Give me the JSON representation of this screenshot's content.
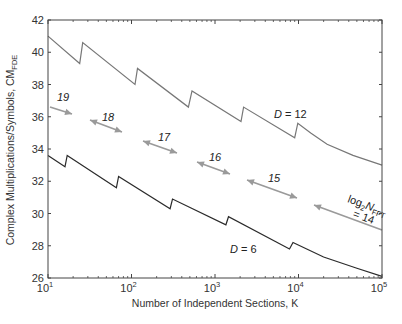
{
  "chart_data": {
    "type": "line",
    "title": "",
    "xlabel": "Number of Independent Sections, K",
    "ylabel": "Complex Multiplications/Symbols, CM",
    "ylabel_subscript": "FDE",
    "xscale": "log",
    "xlim": [
      10,
      100000
    ],
    "ylim": [
      26,
      42
    ],
    "grid": false,
    "x_tick_labels": [
      {
        "base": "10",
        "exp": "1",
        "value": 10
      },
      {
        "base": "10",
        "exp": "2",
        "value": 100
      },
      {
        "base": "10",
        "exp": "3",
        "value": 1000
      },
      {
        "base": "10",
        "exp": "4",
        "value": 10000
      },
      {
        "base": "10",
        "exp": "5",
        "value": 100000
      }
    ],
    "y_ticks": [
      26,
      28,
      30,
      32,
      34,
      36,
      38,
      40,
      42
    ],
    "series": [
      {
        "name": "D = 12",
        "label_italic": "D",
        "label_rest": " = 12",
        "color": "#777777",
        "points": [
          [
            10,
            41.0
          ],
          [
            24,
            39.3
          ],
          [
            26,
            40.6
          ],
          [
            110,
            38.0
          ],
          [
            118,
            39.0
          ],
          [
            480,
            36.6
          ],
          [
            530,
            37.6
          ],
          [
            2050,
            35.7
          ],
          [
            2200,
            36.6
          ],
          [
            9000,
            34.7
          ],
          [
            9800,
            35.6
          ],
          [
            14000,
            35.0
          ],
          [
            22000,
            34.3
          ],
          [
            45000,
            33.6
          ],
          [
            100000,
            33.0
          ]
        ]
      },
      {
        "name": "D = 6",
        "label_italic": "D",
        "label_rest": " = 6",
        "color": "#2b2b2b",
        "points": [
          [
            10,
            33.6
          ],
          [
            16,
            32.9
          ],
          [
            17,
            33.6
          ],
          [
            66,
            31.6
          ],
          [
            70,
            32.3
          ],
          [
            290,
            30.3
          ],
          [
            310,
            30.9
          ],
          [
            1350,
            29.3
          ],
          [
            1450,
            29.8
          ],
          [
            7800,
            27.8
          ],
          [
            8600,
            28.2
          ],
          [
            20000,
            27.3
          ],
          [
            50000,
            26.6
          ],
          [
            100000,
            26.1
          ]
        ]
      }
    ],
    "annotations": [
      {
        "text": "19",
        "type": "arrow-label",
        "x_px": 65,
        "y_px": 99
      },
      {
        "text": "18",
        "type": "arrow-label",
        "x_px": 107,
        "y_px": 120
      },
      {
        "text": "17",
        "type": "arrow-label",
        "x_px": 162,
        "y_px": 140
      },
      {
        "text": "16",
        "type": "arrow-label",
        "x_px": 214,
        "y_px": 160
      },
      {
        "text": "15",
        "type": "arrow-label",
        "x_px": 273,
        "y_px": 180
      },
      {
        "text_main": "log",
        "text_sub": "2",
        "text_N": "N",
        "text_subN": "FFT",
        "text_eq": "= 14",
        "type": "arrow-label"
      }
    ],
    "arrows": [
      {
        "label": "19",
        "x1": 50,
        "y1": 107,
        "x2": 72,
        "y2": 114,
        "heads": "end"
      },
      {
        "label": "18",
        "x1": 90,
        "y1": 120,
        "x2": 122,
        "y2": 132,
        "heads": "both"
      },
      {
        "label": "17",
        "x1": 143,
        "y1": 141,
        "x2": 177,
        "y2": 153,
        "heads": "both"
      },
      {
        "label": "16",
        "x1": 197,
        "y1": 162,
        "x2": 230,
        "y2": 174,
        "heads": "both"
      },
      {
        "label": "15",
        "x1": 247,
        "y1": 180,
        "x2": 297,
        "y2": 198,
        "heads": "both"
      },
      {
        "label": "14",
        "x1": 382,
        "y1": 230,
        "x2": 314,
        "y2": 205,
        "heads": "end"
      }
    ],
    "arrow_color": "#9a9a9a",
    "legend": "inline labels"
  }
}
